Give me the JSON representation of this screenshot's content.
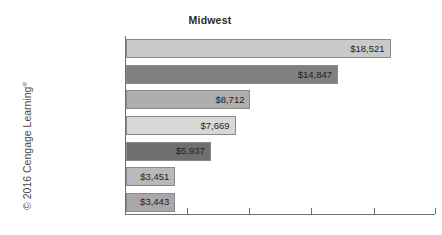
{
  "chart_data": {
    "type": "bar",
    "orientation": "horizontal",
    "title": "Midwest",
    "xlabel": "",
    "ylabel": "",
    "grid": false,
    "legend": false,
    "categories": [
      "Child Care",
      "Housing",
      "College Tuition",
      "Transportation",
      "Food",
      "Utilities",
      "Health Care"
    ],
    "values": [
      18521,
      14847,
      8712,
      7669,
      5937,
      3451,
      3443
    ],
    "value_labels": [
      "$18,521",
      "$14,847",
      "$8,712",
      "$7,669",
      "$5,937",
      "$3,451",
      "$3,443"
    ],
    "xlim": [
      0,
      21700
    ],
    "xticks": [
      0,
      4350,
      8700,
      13050,
      17400,
      21700
    ],
    "xtick_labels": [
      "",
      "",
      "",
      "",
      "",
      ""
    ],
    "bar_colors": [
      "#c9c9c9",
      "#808080",
      "#aeaeae",
      "#d8d8d8",
      "#6f6f6f",
      "#b9b9b9",
      "#a8a8a8"
    ]
  },
  "figure": {
    "title": "Midwest",
    "copyright_prefix": "© 2016 Cengage Learning",
    "copyright_mark": "®"
  }
}
